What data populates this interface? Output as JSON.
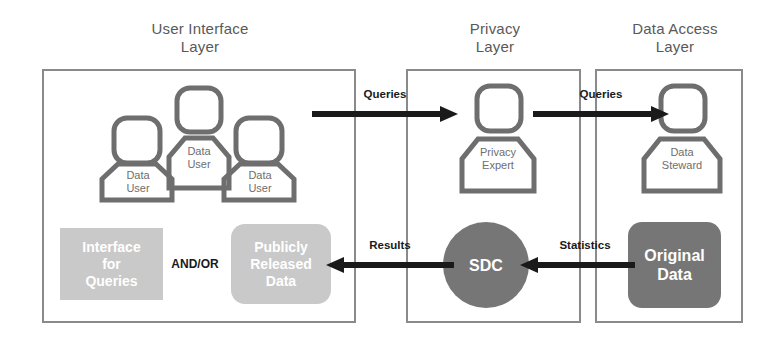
{
  "diagram": {
    "colors": {
      "layer_border": "#8a8a8a",
      "figure_outline": "#6e6e6e",
      "block_light": "#c9c9c9",
      "block_dark": "#767676",
      "arrow": "#1a1a1a",
      "title_text": "#595959",
      "block_text": "#ffffff",
      "background": "#ffffff"
    },
    "layers": [
      {
        "id": "user-interface-layer",
        "title": "User Interface\nLayer"
      },
      {
        "id": "privacy-layer",
        "title": "Privacy\nLayer"
      },
      {
        "id": "data-access-layer",
        "title": "Data Access\nLayer"
      }
    ],
    "figures": [
      {
        "id": "data-user-center",
        "label": "Data\nUser"
      },
      {
        "id": "data-user-left",
        "label": "Data\nUser"
      },
      {
        "id": "data-user-right",
        "label": "Data\nUser"
      },
      {
        "id": "privacy-expert",
        "label": "Privacy\nExpert"
      },
      {
        "id": "data-steward",
        "label": "Data\nSteward"
      }
    ],
    "blocks": [
      {
        "id": "interface-for-queries",
        "label": "Interface\nfor\nQueries"
      },
      {
        "id": "publicly-released-data",
        "label": "Publicly\nReleased\nData"
      },
      {
        "id": "sdc",
        "label": "SDC"
      },
      {
        "id": "original-data",
        "label": "Original\nData"
      }
    ],
    "connector_text": "AND/OR",
    "arrows": [
      {
        "id": "queries-ui-to-privacy",
        "label": "Queries",
        "direction": "right"
      },
      {
        "id": "queries-privacy-to-access",
        "label": "Queries",
        "direction": "right"
      },
      {
        "id": "results-sdc-to-ui",
        "label": "Results",
        "direction": "left"
      },
      {
        "id": "statistics-original-to-sdc",
        "label": "Statistics",
        "direction": "left"
      }
    ]
  }
}
